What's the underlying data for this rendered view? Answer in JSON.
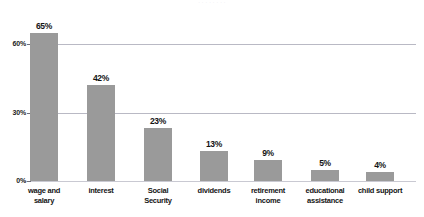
{
  "clipped_header_text": "· · · · · · · ·",
  "colors": {
    "bar_fill": "#9a9a9a",
    "gridline": "#b9b9c4",
    "baseline": "#c9c9d2",
    "text": "#141414",
    "background": "#ffffff"
  },
  "chart_data": {
    "type": "bar",
    "title": "",
    "xlabel": "",
    "ylabel": "",
    "ylim": [
      0,
      70
    ],
    "grid": true,
    "legend": "none",
    "y_ticks": [
      "0%",
      "30%",
      "60%"
    ],
    "y_tick_values": [
      0,
      30,
      60
    ],
    "categories": [
      "wage and\nsalary",
      "interest",
      "Social\nSecurity",
      "dividends",
      "retirement\nincome",
      "educational\nassistance",
      "child support"
    ],
    "values": [
      65,
      42,
      23,
      13,
      9,
      5,
      4
    ],
    "value_labels": [
      "65%",
      "42%",
      "23%",
      "13%",
      "9%",
      "5%",
      "4%"
    ]
  }
}
